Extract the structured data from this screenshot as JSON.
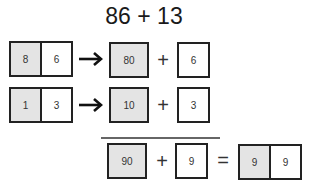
{
  "problem": {
    "title": "86 + 13"
  },
  "rows": [
    {
      "number": {
        "tens": "8",
        "ones": "6"
      },
      "expanded": {
        "tens_value": "80",
        "ones_value": "6"
      },
      "arrow": "right-arrow",
      "operator": "+"
    },
    {
      "number": {
        "tens": "1",
        "ones": "3"
      },
      "expanded": {
        "tens_value": "10",
        "ones_value": "3"
      },
      "arrow": "right-arrow",
      "operator": "+"
    }
  ],
  "result": {
    "tens_sum": "90",
    "plus": "+",
    "ones_sum": "9",
    "equals": "=",
    "answer": {
      "tens": "9",
      "ones": "9"
    }
  },
  "colors": {
    "shaded_fill": "#e4e4e4",
    "border": "#222222",
    "rule": "#666666"
  }
}
